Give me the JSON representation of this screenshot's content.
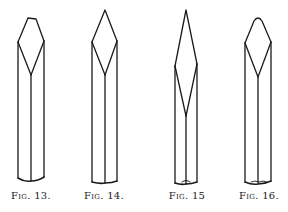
{
  "plate": {
    "background": "#ffffff",
    "stroke_color": "#1a1a1a",
    "figures": [
      {
        "id": "fig-13",
        "label_prefix": "Fig.",
        "label_number": "13.",
        "caption_x": 31
      },
      {
        "id": "fig-14",
        "label_prefix": "Fig.",
        "label_number": "14.",
        "caption_x": 104
      },
      {
        "id": "fig-15",
        "label_prefix": "Fig.",
        "label_number": "15",
        "caption_x": 187
      },
      {
        "id": "fig-16",
        "label_prefix": "Fig.",
        "label_number": "16.",
        "caption_x": 259
      }
    ]
  }
}
